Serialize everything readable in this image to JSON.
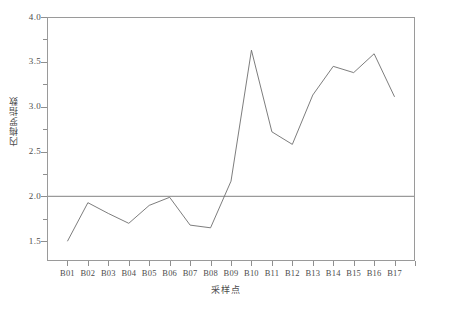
{
  "chart_data": {
    "type": "line",
    "title": "",
    "xlabel": "采样点",
    "ylabel": "内梅罗指数",
    "categories": [
      "B01",
      "B02",
      "B03",
      "B04",
      "B05",
      "B06",
      "B07",
      "B08",
      "B09",
      "B10",
      "B11",
      "B12",
      "B13",
      "B14",
      "B15",
      "B16",
      "B17"
    ],
    "values": [
      1.5,
      1.93,
      1.81,
      1.7,
      1.9,
      1.99,
      1.68,
      1.65,
      2.17,
      3.63,
      2.72,
      2.58,
      3.13,
      3.45,
      3.38,
      3.59,
      3.11
    ],
    "series": [
      {
        "name": "内梅罗指数",
        "values": [
          1.5,
          1.93,
          1.81,
          1.7,
          1.9,
          1.99,
          1.68,
          1.65,
          2.17,
          3.63,
          2.72,
          2.58,
          3.13,
          3.45,
          3.38,
          3.59,
          3.11
        ],
        "color": "#6e6e6e"
      }
    ],
    "reference_lines": [
      {
        "name": "threshold",
        "orientation": "horizontal",
        "value": 2.0,
        "color": "#9a9a9a"
      }
    ],
    "ylim": [
      1.28,
      4.0
    ],
    "xlim": [
      0,
      18
    ],
    "y_ticks_major": [
      1.5,
      2.0,
      2.5,
      3.0,
      3.5,
      4.0
    ],
    "y_tick_labels": [
      "1.5",
      "2.0",
      "2.5",
      "3.0",
      "3.5",
      "4.0"
    ],
    "y_ticks_minor": [
      1.75,
      2.25,
      2.75,
      3.25,
      3.75
    ],
    "grid": false,
    "legend": false,
    "frame": true,
    "line_color": "#6e6e6e",
    "frame_color": "#9a9a9a"
  }
}
